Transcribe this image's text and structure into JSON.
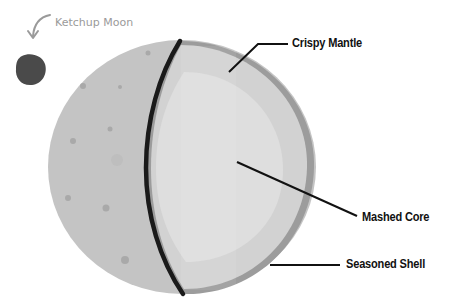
{
  "diagram": {
    "type": "cross-section",
    "labels": {
      "moon": "Ketchup Moon",
      "mantle": "Crispy Mantle",
      "core": "Mashed Core",
      "shell": "Seasoned Shell"
    },
    "colors": {
      "background": "#ffffff",
      "surface": "#c4c4c4",
      "surface_spots": "#a8a8a8",
      "mantle": "#d3d3d3",
      "core": "#dedede",
      "shell": "#9c9c9c",
      "cut_line": "#1a1a1a",
      "moon": "#4a4a4a",
      "moon_label": "#9a9a9a",
      "label_text": "#111111"
    }
  }
}
